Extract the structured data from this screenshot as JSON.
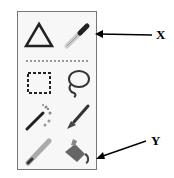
{
  "toolbox": {
    "tools": [
      {
        "name": "triangle-shape-tool",
        "icon": "triangle-icon"
      },
      {
        "name": "eyedropper-tool",
        "icon": "eyedropper-icon"
      },
      {
        "name": "rectangle-select-tool",
        "icon": "dashed-rectangle-icon"
      },
      {
        "name": "lasso-select-tool",
        "icon": "lasso-icon"
      },
      {
        "name": "magic-wand-tool",
        "icon": "magic-wand-icon"
      },
      {
        "name": "paintbrush-tool",
        "icon": "paintbrush-icon"
      },
      {
        "name": "pencil-tool",
        "icon": "pencil-icon"
      },
      {
        "name": "paint-bucket-tool",
        "icon": "paint-bucket-icon"
      }
    ]
  },
  "annotations": {
    "x_label": "X",
    "y_label": "Y"
  }
}
